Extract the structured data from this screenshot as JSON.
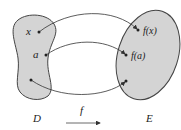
{
  "diagram": {
    "domain_set": {
      "label": "D",
      "fill": "#d4d4d4"
    },
    "codomain_set": {
      "label": "E",
      "fill": "#d4d4d4"
    },
    "function_label": "f",
    "points": [
      {
        "source_label": "x",
        "target_label": "f(x)"
      },
      {
        "source_label": "a",
        "target_label": "f(a)"
      },
      {
        "source_label": "",
        "target_label": ""
      }
    ]
  }
}
